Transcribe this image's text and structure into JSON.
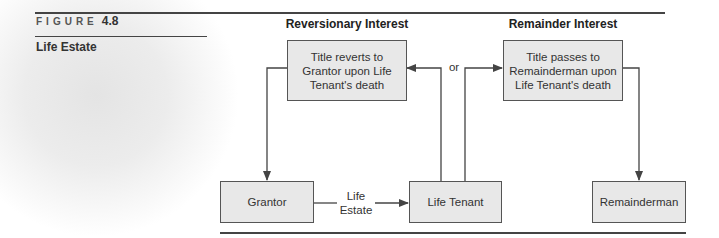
{
  "figure": {
    "label": "FIGURE",
    "number": "4.8",
    "title": "Life Estate"
  },
  "columns": {
    "left_heading": "Reversionary Interest",
    "right_heading": "Remainder Interest"
  },
  "boxes": {
    "reversion": "Title reverts to Grantor upon Life Tenant's death",
    "remainder": "Title passes to Remainderman upon Life Tenant's death",
    "grantor": "Grantor",
    "life_tenant": "Life Tenant",
    "remainderman": "Remainderman"
  },
  "connector_labels": {
    "or": "or",
    "life_estate_line1": "Life",
    "life_estate_line2": "Estate"
  },
  "colors": {
    "box_fill": "#e8e8e8",
    "stroke": "#444444"
  }
}
